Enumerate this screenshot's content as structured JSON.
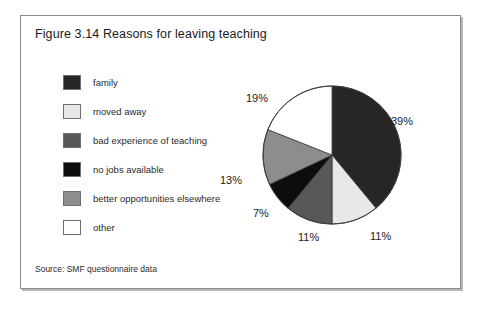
{
  "figure": {
    "title": "Figure 3.14 Reasons for leaving teaching",
    "source": "Source: SMF questionnaire data"
  },
  "chart_data": {
    "type": "pie",
    "title": "Figure 3.14 Reasons for leaving teaching",
    "xlabel": "",
    "ylabel": "",
    "legend_position": "left",
    "start_angle_deg": 0,
    "direction": "clockwise",
    "categories": [
      "family",
      "moved away",
      "bad experience of teaching",
      "no jobs available",
      "better opportunities elsewhere",
      "other"
    ],
    "values": [
      39,
      11,
      11,
      7,
      13,
      19
    ],
    "value_labels": [
      "39%",
      "11%",
      "11%",
      "7%",
      "13%",
      "19%"
    ],
    "colors": [
      "#262626",
      "#e8e8e8",
      "#585858",
      "#0d0d0d",
      "#8d8d8d",
      "#ffffff"
    ],
    "total": 100,
    "units": "percent"
  },
  "legend": {
    "items": [
      {
        "label": "family",
        "color": "#262626",
        "value_label": "39%"
      },
      {
        "label": "moved away",
        "color": "#e8e8e8",
        "value_label": "11%"
      },
      {
        "label": "bad experience of teaching",
        "color": "#585858",
        "value_label": "11%"
      },
      {
        "label": "no jobs available",
        "color": "#0d0d0d",
        "value_label": "7%"
      },
      {
        "label": "better opportunities elsewhere",
        "color": "#8d8d8d",
        "value_label": "13%"
      },
      {
        "label": "other",
        "color": "#ffffff",
        "value_label": "19%"
      }
    ]
  },
  "pie_labels": {
    "family": "39%",
    "moved_away": "11%",
    "bad_experience": "11%",
    "no_jobs": "7%",
    "better_opportunities": "13%",
    "other": "19%"
  }
}
